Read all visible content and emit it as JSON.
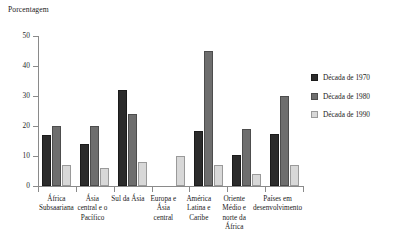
{
  "chart_data": {
    "type": "bar",
    "title": "",
    "xlabel": "",
    "ylabel": "Porcentagem",
    "ylim": [
      0,
      50
    ],
    "yticks": [
      0,
      10,
      20,
      30,
      40,
      50
    ],
    "grid": false,
    "legend_position": "right",
    "categories": [
      "África Subsaariana",
      "Ásia central e o Pacífico",
      "Sul da Ásia",
      "Europa e Ásia central",
      "América Latina e Caribe",
      "Oriente Médio e norte da África",
      "Países em desenvolvimento"
    ],
    "series": [
      {
        "name": "Década de 1970",
        "color": "#2b2b2b",
        "values": [
          17,
          14,
          32,
          null,
          18.5,
          10.5,
          17.5
        ]
      },
      {
        "name": "Década de 1980",
        "color": "#6e6e6e",
        "values": [
          20,
          20,
          24,
          null,
          45,
          19,
          30
        ]
      },
      {
        "name": "Década de 1990",
        "color": "#d8d8d8",
        "values": [
          7,
          6,
          8,
          10,
          7,
          4,
          7
        ]
      }
    ]
  }
}
